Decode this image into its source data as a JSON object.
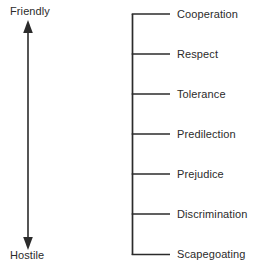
{
  "figure": {
    "background_color": "#ffffff",
    "line_color": "#2b2b2b",
    "text_color": "#2b2b2b"
  },
  "axis": {
    "orientation": "vertical",
    "arrow_style": "double-headed",
    "top_label": "Friendly",
    "bottom_label": "Hostile"
  },
  "scale": {
    "levels": [
      {
        "label": "Cooperation",
        "rank": 1,
        "tick_y": 14
      },
      {
        "label": "Respect",
        "rank": 2,
        "tick_y": 54
      },
      {
        "label": "Tolerance",
        "rank": 3,
        "tick_y": 94
      },
      {
        "label": "Predilection",
        "rank": 4,
        "tick_y": 134
      },
      {
        "label": "Prejudice",
        "rank": 5,
        "tick_y": 174
      },
      {
        "label": "Discrimination",
        "rank": 6,
        "tick_y": 214
      },
      {
        "label": "Scapegoating",
        "rank": 7,
        "tick_y": 254
      }
    ]
  }
}
